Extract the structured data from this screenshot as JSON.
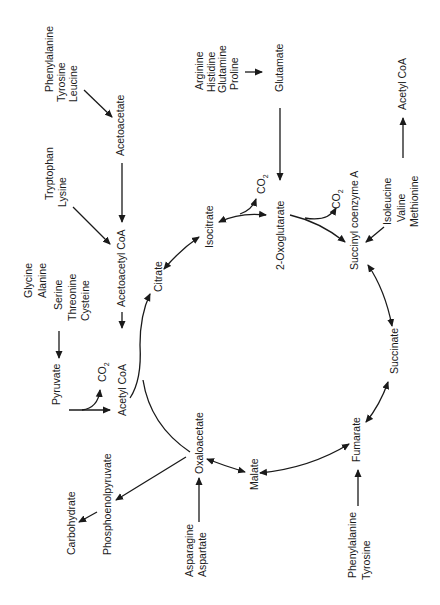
{
  "figure": {
    "orientation": "rotated -90deg"
  },
  "cycle": {
    "citrate": "Citrate",
    "isocitrate": "Isocitrate",
    "oxoglutarate": "2-Oxoglutarate",
    "succinyl_coa": "Succinyl coenzyme A",
    "succinate": "Succinate",
    "fumarate": "Fumarate",
    "malate": "Malate",
    "oxaloacetate": "Oxaloacetate"
  },
  "intermediates": {
    "acetyl_coa": "Acetyl  CoA",
    "acetyl_coa_2": "Acetyl CoA",
    "acetoacetyl_coa": "Acetoacetyl CoA",
    "acetoacetate": "Acetoacetate",
    "pyruvate": "Pyruvate",
    "glutamate": "Glutamate",
    "phosphoenolpyruvate": "Phosphoenolpyruvate",
    "carbohydrate": "Carbohydrate"
  },
  "co2": {
    "label": "CO",
    "subscript": "2"
  },
  "amino_acid_groups": {
    "to_acetoacetate": [
      "Phenylalanine",
      "Tyrosine",
      "Leucine"
    ],
    "to_acetoacetyl_coa": [
      "Tryptophan",
      "Lysine"
    ],
    "to_pyruvate": [
      "Glycine",
      "Alanine",
      "Serine",
      "Threonine",
      "Cysteine"
    ],
    "to_glutamate": [
      "Arginine",
      "Histidine",
      "Glutamine",
      "Proline"
    ],
    "to_succinyl_coa": [
      "Isoleucine",
      "Valine",
      "Methionine"
    ],
    "to_fumarate": [
      "Phenylalanine",
      "Tyrosine"
    ],
    "to_oxaloacetate": [
      "Asparagine",
      "Aspartate"
    ]
  }
}
